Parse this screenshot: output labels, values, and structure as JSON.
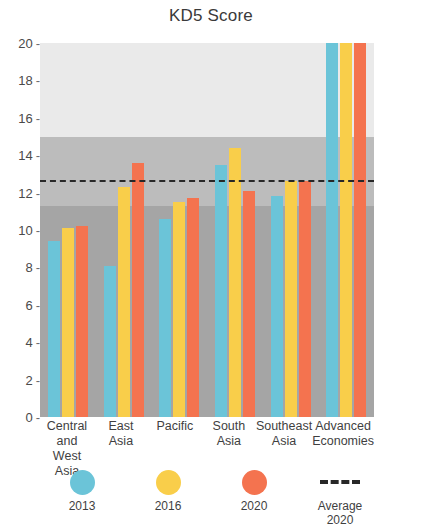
{
  "chart_data": {
    "type": "bar",
    "title": "KD5 Score",
    "xlabel": "",
    "ylabel": "",
    "ylim": [
      0,
      20
    ],
    "yticks": [
      0,
      2,
      4,
      6,
      8,
      10,
      12,
      14,
      16,
      18,
      20
    ],
    "grid": false,
    "legend_position": "bottom",
    "categories": [
      "Central and West Asia",
      "East Asia",
      "Pacific",
      "South Asia",
      "Southeast Asia",
      "Advanced Economies"
    ],
    "series": [
      {
        "name": "2013",
        "color": "#6BC4D8",
        "values": [
          9.4,
          8.1,
          10.6,
          13.5,
          11.8,
          20.0
        ]
      },
      {
        "name": "2016",
        "color": "#F9CE4A",
        "values": [
          10.1,
          12.3,
          11.5,
          14.4,
          12.6,
          20.0
        ]
      },
      {
        "name": "2020",
        "color": "#F4734F",
        "values": [
          10.2,
          13.6,
          11.7,
          12.1,
          12.6,
          20.0
        ]
      }
    ],
    "reference_line": {
      "label": "Average 2020",
      "value": 12.7,
      "style": "dashed",
      "color": "#272727"
    },
    "background_bands": [
      {
        "from": 15.0,
        "to": 20.0,
        "color": "#eaeaea"
      },
      {
        "from": 11.3,
        "to": 15.0,
        "color": "#bcbcbc"
      },
      {
        "from": 0.0,
        "to": 11.3,
        "color": "#a5a5a5"
      }
    ]
  },
  "categories_wrapped": [
    [
      "Central and",
      "West Asia"
    ],
    [
      "East",
      "Asia"
    ],
    [
      "Pacific",
      ""
    ],
    [
      "South",
      "Asia"
    ],
    [
      "Southeast",
      "Asia"
    ],
    [
      "Advanced",
      "Economies"
    ]
  ],
  "legend": {
    "items": [
      {
        "icon": "circle-swatch-2013",
        "label_line1": "2013",
        "label_line2": ""
      },
      {
        "icon": "circle-swatch-2016",
        "label_line1": "2016",
        "label_line2": ""
      },
      {
        "icon": "circle-swatch-2020",
        "label_line1": "2020",
        "label_line2": ""
      },
      {
        "icon": "dashed-line-swatch",
        "label_line1": "Average",
        "label_line2": "2020"
      }
    ]
  }
}
